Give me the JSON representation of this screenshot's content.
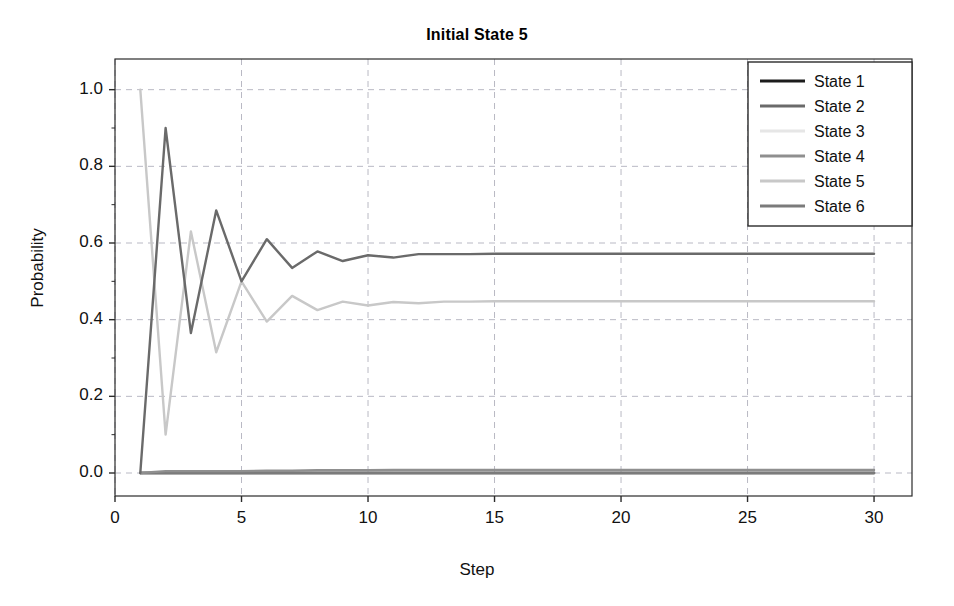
{
  "chart_data": {
    "type": "line",
    "title": "Initial State 5",
    "xlabel": "Step",
    "ylabel": "Probability",
    "xlim": [
      0,
      31.5
    ],
    "ylim": [
      -0.06,
      1.08
    ],
    "grid": true,
    "legend_position": "top-right",
    "xticks": [
      0,
      5,
      10,
      15,
      20,
      25,
      30
    ],
    "xtick_labels": [
      "0",
      "5",
      "10",
      "15",
      "20",
      "25",
      "30"
    ],
    "yticks": [
      0.0,
      0.2,
      0.4,
      0.6,
      0.8,
      1.0
    ],
    "ytick_labels": [
      "0.0",
      "0.2",
      "0.4",
      "0.6",
      "0.8",
      "1.0"
    ],
    "x": [
      1,
      2,
      3,
      4,
      5,
      6,
      7,
      8,
      9,
      10,
      11,
      12,
      13,
      14,
      15,
      16,
      17,
      18,
      19,
      20,
      21,
      22,
      23,
      24,
      25,
      26,
      27,
      28,
      29,
      30
    ],
    "series": [
      {
        "name": "State 1",
        "color": "#1c1c1c",
        "values": [
          0.0,
          0.0,
          0.0,
          0.0,
          0.0,
          0.0,
          0.0,
          0.0,
          0.0,
          0.0,
          0.0,
          0.0,
          0.0,
          0.0,
          0.0,
          0.0,
          0.0,
          0.0,
          0.0,
          0.0,
          0.0,
          0.0,
          0.0,
          0.0,
          0.0,
          0.0,
          0.0,
          0.0,
          0.0,
          0.0
        ]
      },
      {
        "name": "State 2",
        "color": "#6a6a6a",
        "values": [
          0.0,
          0.9,
          0.365,
          0.685,
          0.5,
          0.61,
          0.535,
          0.578,
          0.553,
          0.568,
          0.562,
          0.571,
          0.571,
          0.571,
          0.572,
          0.572,
          0.572,
          0.572,
          0.572,
          0.572,
          0.572,
          0.572,
          0.572,
          0.572,
          0.572,
          0.572,
          0.572,
          0.572,
          0.572,
          0.572
        ]
      },
      {
        "name": "State 3",
        "color": "#e6e6e6",
        "values": [
          0.0,
          0.0,
          0.0,
          0.0,
          0.0,
          0.0,
          0.0,
          0.0,
          0.0,
          0.0,
          0.0,
          0.0,
          0.0,
          0.0,
          0.0,
          0.0,
          0.0,
          0.0,
          0.0,
          0.0,
          0.0,
          0.0,
          0.0,
          0.0,
          0.0,
          0.0,
          0.0,
          0.0,
          0.0,
          0.0
        ]
      },
      {
        "name": "State 4",
        "color": "#8f8f8f",
        "values": [
          0.0,
          0.005,
          0.005,
          0.005,
          0.005,
          0.006,
          0.006,
          0.007,
          0.007,
          0.007,
          0.008,
          0.008,
          0.008,
          0.008,
          0.008,
          0.008,
          0.008,
          0.008,
          0.008,
          0.008,
          0.008,
          0.008,
          0.008,
          0.008,
          0.008,
          0.008,
          0.008,
          0.008,
          0.008,
          0.008
        ]
      },
      {
        "name": "State 5",
        "color": "#c8c8c8",
        "values": [
          1.0,
          0.1,
          0.63,
          0.315,
          0.5,
          0.395,
          0.462,
          0.425,
          0.447,
          0.437,
          0.446,
          0.443,
          0.447,
          0.447,
          0.448,
          0.448,
          0.448,
          0.448,
          0.448,
          0.448,
          0.448,
          0.448,
          0.448,
          0.448,
          0.448,
          0.448,
          0.448,
          0.448,
          0.448,
          0.448
        ]
      },
      {
        "name": "State 6",
        "color": "#7b7b7b",
        "values": [
          0.0,
          0.0,
          0.0,
          0.0,
          0.0,
          0.0,
          0.0,
          0.0,
          0.0,
          0.0,
          0.0,
          0.0,
          0.0,
          0.0,
          0.0,
          0.0,
          0.0,
          0.0,
          0.0,
          0.0,
          0.0,
          0.0,
          0.0,
          0.0,
          0.0,
          0.0,
          0.0,
          0.0,
          0.0,
          0.0
        ]
      }
    ],
    "legend": [
      {
        "label": "State 1",
        "color": "#1c1c1c"
      },
      {
        "label": "State 2",
        "color": "#6a6a6a"
      },
      {
        "label": "State 3",
        "color": "#e6e6e6"
      },
      {
        "label": "State 4",
        "color": "#8f8f8f"
      },
      {
        "label": "State 5",
        "color": "#c8c8c8"
      },
      {
        "label": "State 6",
        "color": "#7b7b7b"
      }
    ],
    "colors": {
      "axis": "#2b2b2b",
      "grid": "#b9b9c4",
      "text": "#111111",
      "background": "#ffffff"
    }
  }
}
